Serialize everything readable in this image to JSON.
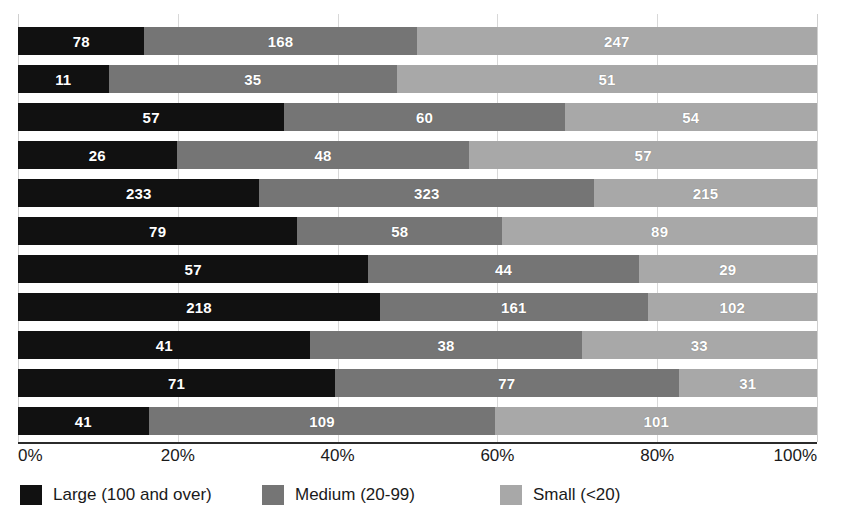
{
  "chart_data": {
    "type": "bar",
    "subtype": "stacked-horizontal-100-percent",
    "title": "",
    "xlabel": "",
    "ylabel": "",
    "xlim": [
      0,
      100
    ],
    "xtick_labels": [
      "0%",
      "20%",
      "40%",
      "60%",
      "80%",
      "100%"
    ],
    "xtick_values": [
      0,
      20,
      40,
      60,
      80,
      100
    ],
    "grid": true,
    "grid_axis": "x",
    "legend_position": "bottom-left",
    "categories": [
      "",
      "",
      "",
      "",
      "",
      "",
      "",
      "",
      "",
      "",
      ""
    ],
    "series": [
      {
        "name": "Large (100 and over)",
        "color": "#111111",
        "values": [
          78,
          11,
          57,
          26,
          233,
          79,
          57,
          218,
          41,
          71,
          41
        ]
      },
      {
        "name": "Medium (20-99)",
        "color": "#757575",
        "values": [
          168,
          35,
          60,
          48,
          323,
          58,
          44,
          161,
          38,
          77,
          109
        ]
      },
      {
        "name": "Small (<20)",
        "color": "#a8a8a8",
        "values": [
          247,
          51,
          54,
          57,
          215,
          89,
          29,
          102,
          33,
          31,
          101
        ]
      }
    ],
    "rows": [
      {
        "large": 78,
        "medium": 168,
        "small": 247,
        "total": 493,
        "pct": [
          15.8,
          34.1,
          50.1
        ]
      },
      {
        "large": 11,
        "medium": 35,
        "small": 51,
        "total": 97,
        "pct": [
          11.3,
          36.1,
          52.6
        ]
      },
      {
        "large": 57,
        "medium": 60,
        "small": 54,
        "total": 171,
        "pct": [
          33.3,
          35.1,
          31.6
        ]
      },
      {
        "large": 26,
        "medium": 48,
        "small": 57,
        "total": 131,
        "pct": [
          19.8,
          36.7,
          43.5
        ]
      },
      {
        "large": 233,
        "medium": 323,
        "small": 215,
        "total": 771,
        "pct": [
          30.2,
          41.9,
          27.9
        ]
      },
      {
        "large": 79,
        "medium": 58,
        "small": 89,
        "total": 226,
        "pct": [
          35.0,
          25.7,
          39.3
        ]
      },
      {
        "large": 57,
        "medium": 44,
        "small": 29,
        "total": 130,
        "pct": [
          43.8,
          33.9,
          22.3
        ]
      },
      {
        "large": 218,
        "medium": 161,
        "small": 102,
        "total": 481,
        "pct": [
          45.3,
          33.5,
          21.2
        ]
      },
      {
        "large": 41,
        "medium": 38,
        "small": 33,
        "total": 112,
        "pct": [
          36.6,
          33.9,
          29.5
        ]
      },
      {
        "large": 71,
        "medium": 77,
        "small": 31,
        "total": 179,
        "pct": [
          39.7,
          43.0,
          17.3
        ]
      },
      {
        "large": 41,
        "medium": 109,
        "small": 101,
        "total": 251,
        "pct": [
          16.3,
          43.4,
          40.3
        ]
      }
    ]
  },
  "axis": {
    "ticks": [
      {
        "label": "0%",
        "value": 0
      },
      {
        "label": "20%",
        "value": 20
      },
      {
        "label": "40%",
        "value": 40
      },
      {
        "label": "60%",
        "value": 60
      },
      {
        "label": "80%",
        "value": 80
      },
      {
        "label": "100%",
        "value": 100
      }
    ]
  },
  "legend": {
    "items": [
      {
        "label": "Large (100 and over)",
        "color": "#111111",
        "key": "large"
      },
      {
        "label": "Medium (20-99)",
        "color": "#757575",
        "key": "medium"
      },
      {
        "label": "Small (<20)",
        "color": "#a8a8a8",
        "key": "small"
      }
    ]
  },
  "colors": {
    "large": "#111111",
    "medium": "#757575",
    "small": "#a8a8a8",
    "axis": "#2b2b2b",
    "grid": "#d8d8d8",
    "label_text": "#ffffff",
    "background": "#ffffff"
  }
}
